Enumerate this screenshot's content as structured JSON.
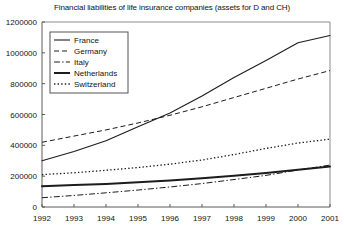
{
  "chart_data": {
    "type": "line",
    "title": "Financial liabilities of life insurance companies (assets for D and CH)",
    "xlabel": "",
    "ylabel": "",
    "x": [
      1992,
      1993,
      1994,
      1995,
      1996,
      1997,
      1998,
      1999,
      2000,
      2001
    ],
    "xtick_labels": [
      "1992",
      "1993",
      "1994",
      "1995",
      "1996",
      "1997",
      "1998",
      "1999",
      "2000",
      "2001"
    ],
    "ytick_labels": [
      "0",
      "200000",
      "400000",
      "600000",
      "800000",
      "1000000",
      "1200000"
    ],
    "yticks": [
      0,
      200000,
      400000,
      600000,
      800000,
      1000000,
      1200000
    ],
    "ylim": [
      0,
      1200000
    ],
    "xlim": [
      1992,
      2001
    ],
    "grid": false,
    "legend_position": "upper-left",
    "series": [
      {
        "name": "France",
        "style": "solid",
        "width": 1.1,
        "color": "#1c1c1c",
        "values": [
          300000,
          360000,
          430000,
          520000,
          610000,
          720000,
          840000,
          950000,
          1065000,
          1112000
        ]
      },
      {
        "name": "Germany",
        "style": "dashed",
        "width": 1.0,
        "color": "#1c1c1c",
        "values": [
          420000,
          460000,
          500000,
          545000,
          595000,
          650000,
          710000,
          770000,
          830000,
          885000
        ]
      },
      {
        "name": "Italy",
        "style": "dash-dot",
        "width": 1.0,
        "color": "#1c1c1c",
        "values": [
          60000,
          75000,
          92000,
          110000,
          130000,
          152000,
          178000,
          205000,
          240000,
          272000
        ]
      },
      {
        "name": "Netherlands",
        "style": "solid",
        "width": 2.0,
        "color": "#1c1c1c",
        "values": [
          135000,
          142000,
          150000,
          160000,
          172000,
          186000,
          202000,
          220000,
          242000,
          262000
        ]
      },
      {
        "name": "Switzerland",
        "style": "dotted",
        "width": 1.3,
        "color": "#1c1c1c",
        "values": [
          210000,
          222000,
          238000,
          256000,
          278000,
          305000,
          340000,
          380000,
          415000,
          440000
        ]
      }
    ]
  },
  "legend": {
    "entries": [
      {
        "label": "France"
      },
      {
        "label": "Germany"
      },
      {
        "label": "Italy"
      },
      {
        "label": "Netherlands"
      },
      {
        "label": "Switzerland"
      }
    ]
  }
}
